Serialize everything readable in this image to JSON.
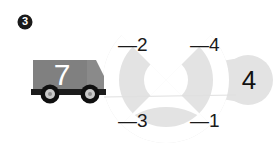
{
  "page": {
    "background_color": "#ffffff",
    "width": 278,
    "height": 155
  },
  "badge": {
    "label": "3",
    "fill": "#1a1a1a",
    "text_color": "#ffffff"
  },
  "truck": {
    "label": "7",
    "body_color": "#808080",
    "cab_color": "#8a8a8a",
    "label_color": "#ffffff",
    "wheel_color": "#101010",
    "hubcap_color": "#c9c9c9"
  },
  "wheel_graphic": {
    "fill": "#e3e3e3",
    "spoke_color": "#ffffff",
    "quadrant_labels": [
      {
        "position": "upper-left",
        "text": "—2"
      },
      {
        "position": "upper-right",
        "text": "—4"
      },
      {
        "position": "lower-left",
        "text": "—3"
      },
      {
        "position": "lower-right",
        "text": "—1"
      }
    ]
  },
  "side_node": {
    "label": "4",
    "fill": "#e3e3e3",
    "text_color": "#111111"
  }
}
